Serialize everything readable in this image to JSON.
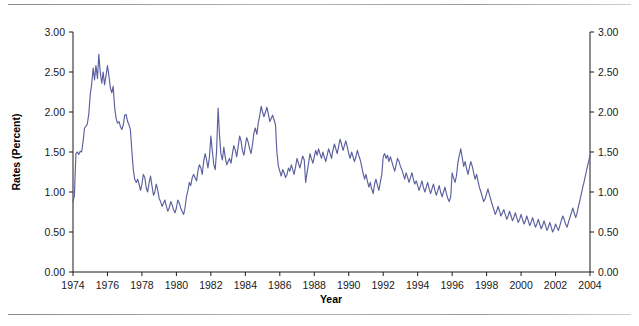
{
  "figure": {
    "rule_top_label": "",
    "rule_bottom_label": ""
  },
  "chart_data": {
    "type": "line",
    "title": "",
    "xlabel": "Year",
    "ylabel": "Rates (Percent)",
    "xlim": [
      1974,
      2004
    ],
    "ylim": [
      0.0,
      3.0
    ],
    "grid": false,
    "legend": "none",
    "line_color": "#5b5f9e",
    "axis_color": "#1a1a1a",
    "y_ticks": [
      0.0,
      0.5,
      1.0,
      1.5,
      2.0,
      2.5,
      3.0
    ],
    "y_tick_labels": [
      "0.00",
      "0.50",
      "1.00",
      "1.50",
      "2.00",
      "2.50",
      "3.00"
    ],
    "y_axis_right_labels": [
      "0.00",
      "0.50",
      "1.00",
      "1.50",
      "2.00",
      "2.50",
      "3.00"
    ],
    "x_ticks": [
      1974,
      1976,
      1978,
      1980,
      1982,
      1984,
      1986,
      1988,
      1990,
      1992,
      1994,
      1996,
      1998,
      2000,
      2002,
      2004
    ],
    "x_tick_labels": [
      "1974",
      "1976",
      "1978",
      "1980",
      "1982",
      "1984",
      "1986",
      "1988",
      "1990",
      "1992",
      "1994",
      "1996",
      "1998",
      "2000",
      "2002",
      "2004"
    ],
    "series": [
      {
        "name": "Rates",
        "x": [
          1974.0,
          1974.08,
          1974.17,
          1974.25,
          1974.33,
          1974.42,
          1974.5,
          1974.58,
          1974.67,
          1974.75,
          1974.83,
          1974.92,
          1975.0,
          1975.08,
          1975.17,
          1975.25,
          1975.33,
          1975.42,
          1975.5,
          1975.58,
          1975.67,
          1975.75,
          1975.83,
          1975.92,
          1976.0,
          1976.08,
          1976.17,
          1976.25,
          1976.33,
          1976.42,
          1976.5,
          1976.58,
          1976.67,
          1976.75,
          1976.83,
          1976.92,
          1977.0,
          1977.08,
          1977.17,
          1977.25,
          1977.33,
          1977.42,
          1977.5,
          1977.58,
          1977.67,
          1977.75,
          1977.83,
          1977.92,
          1978.0,
          1978.08,
          1978.17,
          1978.25,
          1978.33,
          1978.42,
          1978.5,
          1978.58,
          1978.67,
          1978.75,
          1978.83,
          1978.92,
          1979.0,
          1979.08,
          1979.17,
          1979.25,
          1979.33,
          1979.42,
          1979.5,
          1979.58,
          1979.67,
          1979.75,
          1979.83,
          1979.92,
          1980.0,
          1980.08,
          1980.17,
          1980.25,
          1980.33,
          1980.42,
          1980.5,
          1980.58,
          1980.67,
          1980.75,
          1980.83,
          1980.92,
          1981.0,
          1981.08,
          1981.17,
          1981.25,
          1981.33,
          1981.42,
          1981.5,
          1981.58,
          1981.67,
          1981.75,
          1981.83,
          1981.92,
          1982.0,
          1982.08,
          1982.17,
          1982.25,
          1982.33,
          1982.42,
          1982.5,
          1982.58,
          1982.67,
          1982.75,
          1982.83,
          1982.92,
          1983.0,
          1983.08,
          1983.17,
          1983.25,
          1983.33,
          1983.42,
          1983.5,
          1983.58,
          1983.67,
          1983.75,
          1983.83,
          1983.92,
          1984.0,
          1984.08,
          1984.17,
          1984.25,
          1984.33,
          1984.42,
          1984.5,
          1984.58,
          1984.67,
          1984.75,
          1984.83,
          1984.92,
          1985.0,
          1985.08,
          1985.17,
          1985.25,
          1985.33,
          1985.42,
          1985.5,
          1985.58,
          1985.67,
          1985.75,
          1985.83,
          1985.92,
          1986.0,
          1986.08,
          1986.17,
          1986.25,
          1986.33,
          1986.42,
          1986.5,
          1986.58,
          1986.67,
          1986.75,
          1986.83,
          1986.92,
          1987.0,
          1987.08,
          1987.17,
          1987.25,
          1987.33,
          1987.42,
          1987.5,
          1987.58,
          1987.67,
          1987.75,
          1987.83,
          1987.92,
          1988.0,
          1988.08,
          1988.17,
          1988.25,
          1988.33,
          1988.42,
          1988.5,
          1988.58,
          1988.67,
          1988.75,
          1988.83,
          1988.92,
          1989.0,
          1989.08,
          1989.17,
          1989.25,
          1989.33,
          1989.42,
          1989.5,
          1989.58,
          1989.67,
          1989.75,
          1989.83,
          1989.92,
          1990.0,
          1990.08,
          1990.17,
          1990.25,
          1990.33,
          1990.42,
          1990.5,
          1990.58,
          1990.67,
          1990.75,
          1990.83,
          1990.92,
          1991.0,
          1991.08,
          1991.17,
          1991.25,
          1991.33,
          1991.42,
          1991.5,
          1991.58,
          1991.67,
          1991.75,
          1991.83,
          1991.92,
          1992.0,
          1992.08,
          1992.17,
          1992.25,
          1992.33,
          1992.42,
          1992.5,
          1992.58,
          1992.67,
          1992.75,
          1992.83,
          1992.92,
          1993.0,
          1993.08,
          1993.17,
          1993.25,
          1993.33,
          1993.42,
          1993.5,
          1993.58,
          1993.67,
          1993.75,
          1993.83,
          1993.92,
          1994.0,
          1994.08,
          1994.17,
          1994.25,
          1994.33,
          1994.42,
          1994.5,
          1994.58,
          1994.67,
          1994.75,
          1994.83,
          1994.92,
          1995.0,
          1995.08,
          1995.17,
          1995.25,
          1995.33,
          1995.42,
          1995.5,
          1995.58,
          1995.67,
          1995.75,
          1995.83,
          1995.92,
          1996.0,
          1996.08,
          1996.17,
          1996.25,
          1996.33,
          1996.42,
          1996.5,
          1996.58,
          1996.67,
          1996.75,
          1996.83,
          1996.92,
          1997.0,
          1997.08,
          1997.17,
          1997.25,
          1997.33,
          1997.42,
          1997.5,
          1997.58,
          1997.67,
          1997.75,
          1997.83,
          1997.92,
          1998.0,
          1998.08,
          1998.17,
          1998.25,
          1998.33,
          1998.42,
          1998.5,
          1998.58,
          1998.67,
          1998.75,
          1998.83,
          1998.92,
          1999.0,
          1999.08,
          1999.17,
          1999.25,
          1999.33,
          1999.42,
          1999.5,
          1999.58,
          1999.67,
          1999.75,
          1999.83,
          1999.92,
          2000.0,
          2000.08,
          2000.17,
          2000.25,
          2000.33,
          2000.42,
          2000.5,
          2000.58,
          2000.67,
          2000.75,
          2000.83,
          2000.92,
          2001.0,
          2001.08,
          2001.17,
          2001.25,
          2001.33,
          2001.42,
          2001.5,
          2001.58,
          2001.67,
          2001.75,
          2001.83,
          2001.92,
          2002.0,
          2002.08,
          2002.17,
          2002.25,
          2002.33,
          2002.42,
          2002.5,
          2002.58,
          2002.67,
          2002.75,
          2002.83,
          2002.92,
          2003.0,
          2003.08,
          2003.17,
          2003.25,
          2003.33,
          2003.42,
          2003.5,
          2003.58,
          2003.67,
          2003.75,
          2003.83,
          2003.92,
          2004.0
        ],
        "values": [
          0.88,
          0.95,
          1.48,
          1.5,
          1.47,
          1.51,
          1.5,
          1.62,
          1.8,
          1.82,
          1.85,
          1.98,
          2.22,
          2.34,
          2.55,
          2.4,
          2.58,
          2.42,
          2.72,
          2.5,
          2.36,
          2.5,
          2.34,
          2.46,
          2.58,
          2.46,
          2.3,
          2.24,
          2.32,
          2.05,
          1.92,
          1.86,
          1.88,
          1.82,
          1.78,
          1.84,
          1.96,
          1.97,
          1.88,
          1.84,
          1.78,
          1.5,
          1.28,
          1.16,
          1.12,
          1.16,
          1.1,
          1.02,
          1.1,
          1.22,
          1.18,
          1.05,
          1.0,
          1.12,
          1.2,
          1.08,
          0.96,
          1.0,
          1.1,
          1.02,
          0.92,
          0.88,
          0.82,
          0.86,
          0.9,
          0.82,
          0.76,
          0.8,
          0.88,
          0.84,
          0.78,
          0.74,
          0.8,
          0.9,
          0.86,
          0.8,
          0.76,
          0.72,
          0.8,
          0.94,
          1.02,
          1.12,
          1.08,
          1.18,
          1.22,
          1.18,
          1.14,
          1.26,
          1.34,
          1.3,
          1.22,
          1.38,
          1.48,
          1.4,
          1.3,
          1.44,
          1.7,
          1.52,
          1.34,
          1.28,
          1.5,
          2.05,
          1.72,
          1.48,
          1.4,
          1.56,
          1.44,
          1.34,
          1.38,
          1.42,
          1.36,
          1.48,
          1.58,
          1.52,
          1.44,
          1.56,
          1.7,
          1.64,
          1.52,
          1.46,
          1.58,
          1.68,
          1.62,
          1.54,
          1.48,
          1.6,
          1.74,
          1.8,
          1.72,
          1.86,
          1.95,
          2.07,
          2.0,
          1.94,
          2.0,
          2.06,
          1.98,
          1.88,
          1.92,
          1.96,
          1.9,
          1.84,
          1.5,
          1.32,
          1.26,
          1.2,
          1.28,
          1.24,
          1.18,
          1.22,
          1.3,
          1.26,
          1.34,
          1.28,
          1.22,
          1.32,
          1.42,
          1.36,
          1.3,
          1.38,
          1.45,
          1.4,
          1.12,
          1.24,
          1.36,
          1.48,
          1.42,
          1.36,
          1.44,
          1.52,
          1.46,
          1.54,
          1.48,
          1.42,
          1.5,
          1.44,
          1.38,
          1.46,
          1.54,
          1.48,
          1.42,
          1.52,
          1.6,
          1.54,
          1.48,
          1.58,
          1.66,
          1.6,
          1.52,
          1.58,
          1.64,
          1.56,
          1.48,
          1.42,
          1.5,
          1.44,
          1.38,
          1.44,
          1.52,
          1.46,
          1.4,
          1.32,
          1.24,
          1.16,
          1.22,
          1.14,
          1.06,
          1.12,
          1.04,
          0.98,
          1.1,
          1.16,
          1.08,
          1.02,
          1.12,
          1.22,
          1.44,
          1.48,
          1.42,
          1.46,
          1.38,
          1.44,
          1.38,
          1.32,
          1.26,
          1.34,
          1.42,
          1.38,
          1.32,
          1.28,
          1.22,
          1.16,
          1.24,
          1.18,
          1.12,
          1.18,
          1.24,
          1.16,
          1.1,
          1.14,
          1.08,
          1.02,
          1.08,
          1.14,
          1.06,
          1.0,
          1.06,
          1.12,
          1.04,
          0.98,
          1.04,
          1.1,
          1.02,
          0.96,
          1.02,
          1.08,
          1.0,
          0.94,
          1.0,
          1.06,
          0.98,
          0.92,
          0.88,
          0.94,
          1.24,
          1.18,
          1.12,
          1.2,
          1.36,
          1.46,
          1.54,
          1.44,
          1.32,
          1.38,
          1.3,
          1.22,
          1.3,
          1.38,
          1.32,
          1.24,
          1.16,
          1.22,
          1.14,
          1.06,
          1.0,
          0.94,
          0.88,
          0.92,
          0.98,
          1.04,
          0.96,
          0.9,
          0.84,
          0.78,
          0.72,
          0.76,
          0.82,
          0.76,
          0.7,
          0.74,
          0.78,
          0.72,
          0.66,
          0.7,
          0.76,
          0.7,
          0.64,
          0.68,
          0.74,
          0.68,
          0.62,
          0.66,
          0.72,
          0.66,
          0.6,
          0.64,
          0.7,
          0.64,
          0.58,
          0.62,
          0.68,
          0.62,
          0.56,
          0.6,
          0.66,
          0.6,
          0.54,
          0.58,
          0.64,
          0.58,
          0.52,
          0.56,
          0.62,
          0.56,
          0.5,
          0.54,
          0.6,
          0.56,
          0.52,
          0.58,
          0.64,
          0.7,
          0.66,
          0.6,
          0.56,
          0.62,
          0.68,
          0.74,
          0.8,
          0.74,
          0.68,
          0.74,
          0.82,
          0.9,
          0.98,
          1.06,
          1.14,
          1.22,
          1.3,
          1.38,
          1.46
        ]
      }
    ]
  },
  "axes": {
    "left_ticks": [
      "3.00",
      "2.50",
      "2.00",
      "1.50",
      "1.00",
      "0.50",
      "0.00"
    ],
    "right_ticks": [
      "3.00",
      "2.50",
      "2.00",
      "1.50",
      "1.00",
      "0.50",
      "0.00"
    ],
    "x_labels": [
      "1974",
      "1976",
      "1978",
      "1980",
      "1982",
      "1984",
      "1986",
      "1988",
      "1990",
      "1992",
      "1994",
      "1996",
      "1998",
      "2000",
      "2002",
      "2004"
    ],
    "x_axis_title": "Year",
    "y_axis_title": "Rates (Percent)"
  }
}
